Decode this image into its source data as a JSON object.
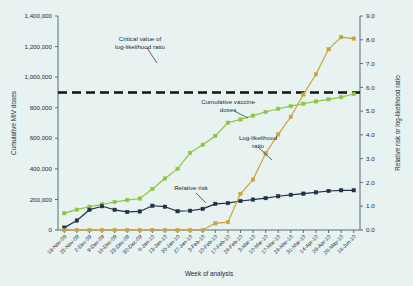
{
  "chart_data": {
    "type": "line",
    "title": "",
    "subtitle": "",
    "xlabel": "Week of analysis",
    "ylabel": "Cumulative MIV doses",
    "y2label": "Relative risk or log-likelihood ratio",
    "grid": false,
    "legend_position": "inline-annotations",
    "ylim": [
      0,
      1400000
    ],
    "y2lim": [
      0,
      9.0
    ],
    "ytick_labels": [
      "0",
      "200,000",
      "400,000",
      "600,000",
      "800,000",
      "1,000,000",
      "1,200,000",
      "1,400,000"
    ],
    "ytick_values": [
      0,
      200000,
      400000,
      600000,
      800000,
      1000000,
      1200000,
      1400000
    ],
    "y2tick_labels": [
      "0.0",
      "1.0",
      "2.0",
      "3.0",
      "4.0",
      "5.0",
      "6.0",
      "7.0",
      "8.0",
      "9.0"
    ],
    "y2tick_values": [
      0,
      1,
      2,
      3,
      4,
      5,
      6,
      7,
      8,
      9
    ],
    "categories": [
      "18-Nov-09",
      "25-Nov-09",
      "2-Dec-09",
      "9-Dec-09",
      "16-Dec-09",
      "23-Dec-09",
      "30-Dec-09",
      "6-Jan-10",
      "13-Jan-10",
      "20-Jan-10",
      "27-Jan-10",
      "3-Feb-10",
      "10-Feb-10",
      "17-Feb-10",
      "24-Feb-10",
      "3-Mar-10",
      "10-Mar-10",
      "17-Mar-10",
      "24-Mar-10",
      "31-Mar-10",
      "14-Apr-10",
      "28-Apr-10",
      "26-May-10",
      "16-Jun-10"
    ],
    "series": [
      {
        "name": "Cumulative vaccine doses",
        "axis": "left",
        "color": "#8cc63f",
        "marker": "square",
        "values": [
          110000,
          133000,
          152000,
          168000,
          183000,
          196000,
          206000,
          268000,
          337000,
          400000,
          505000,
          558000,
          615000,
          702000,
          723000,
          748000,
          772000,
          793000,
          810000,
          826000,
          841000,
          855000,
          869000,
          890000
        ]
      },
      {
        "name": "Relative risk",
        "axis": "right",
        "color": "#1f3048",
        "marker": "square",
        "values": [
          0.1,
          0.4,
          0.85,
          1.0,
          0.85,
          0.76,
          0.78,
          1.02,
          0.98,
          0.79,
          0.81,
          0.89,
          1.1,
          1.13,
          1.22,
          1.28,
          1.34,
          1.42,
          1.48,
          1.53,
          1.58,
          1.64,
          1.67,
          1.67
        ]
      },
      {
        "name": "Log-likelihood ratio",
        "axis": "right",
        "color": "#c9a43a",
        "marker": "square",
        "values": [
          0.0,
          0.0,
          0.0,
          0.0,
          0.0,
          0.0,
          0.0,
          0.0,
          0.0,
          0.0,
          0.0,
          0.0,
          0.28,
          0.33,
          1.52,
          2.12,
          3.22,
          4.02,
          4.76,
          5.7,
          6.55,
          7.6,
          8.11,
          8.05
        ]
      }
    ],
    "reference_lines": [
      {
        "name": "Critical value of log-likelihood ratio",
        "axis": "right",
        "value": 5.78,
        "color": "#111111",
        "style": "dashed"
      }
    ],
    "annotations": [
      {
        "id": "critical",
        "text_line1": "Critical value of",
        "text_line2": "log-likelihood ratio"
      },
      {
        "id": "vaccine",
        "text_line1": "Cumulative vaccine",
        "text_line2": "doses"
      },
      {
        "id": "loglik",
        "text_line1": "Log-likelihood",
        "text_line2": "ratio"
      },
      {
        "id": "relrisk",
        "text_line1": "Relative risk",
        "text_line2": ""
      }
    ]
  }
}
